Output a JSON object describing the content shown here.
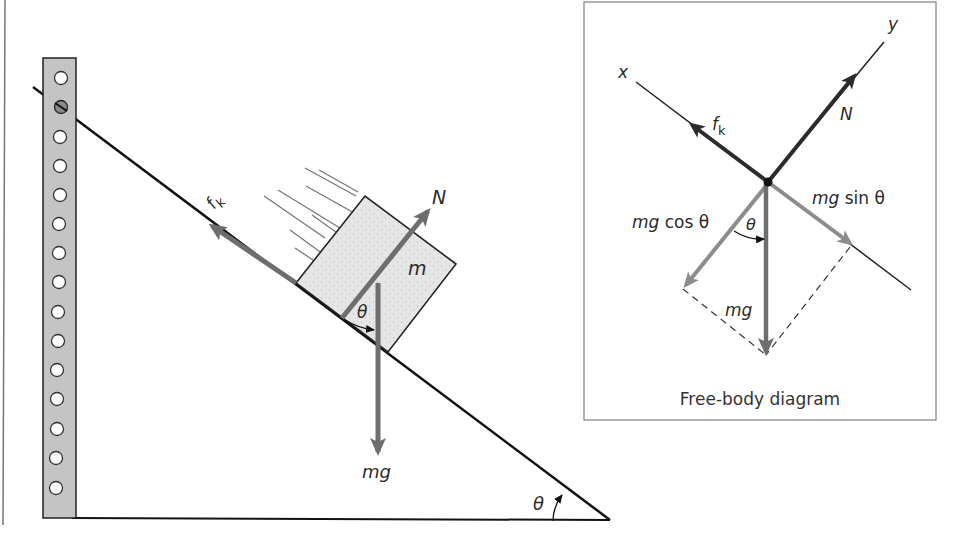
{
  "figure": {
    "type": "physics-diagram"
  },
  "main_diagram": {
    "labels": {
      "friction": "f",
      "friction_sub": "k",
      "normal": "N",
      "mass": "m",
      "weight": "mg",
      "angle_at_block": "θ",
      "angle_at_base": "θ"
    }
  },
  "free_body_diagram": {
    "caption": "Free-body diagram",
    "labels": {
      "x_axis": "x",
      "y_axis": "y",
      "friction": "f",
      "friction_sub": "k",
      "normal": "N",
      "parallel_component_prefix": "mg",
      "parallel_component_suffix": " sin θ",
      "perpendicular_component_prefix": "mg",
      "perpendicular_component_suffix": " cos θ",
      "angle": "θ",
      "weight": "mg"
    }
  },
  "colors": {
    "line": "#111111",
    "vector": "#6e6e6e",
    "vector_dark": "#2b2b2b",
    "component": "#8c8c8c",
    "block_fill": "#e4e4e4",
    "post_fill": "#c4c4c4",
    "panel_border": "#8a8a8a"
  }
}
